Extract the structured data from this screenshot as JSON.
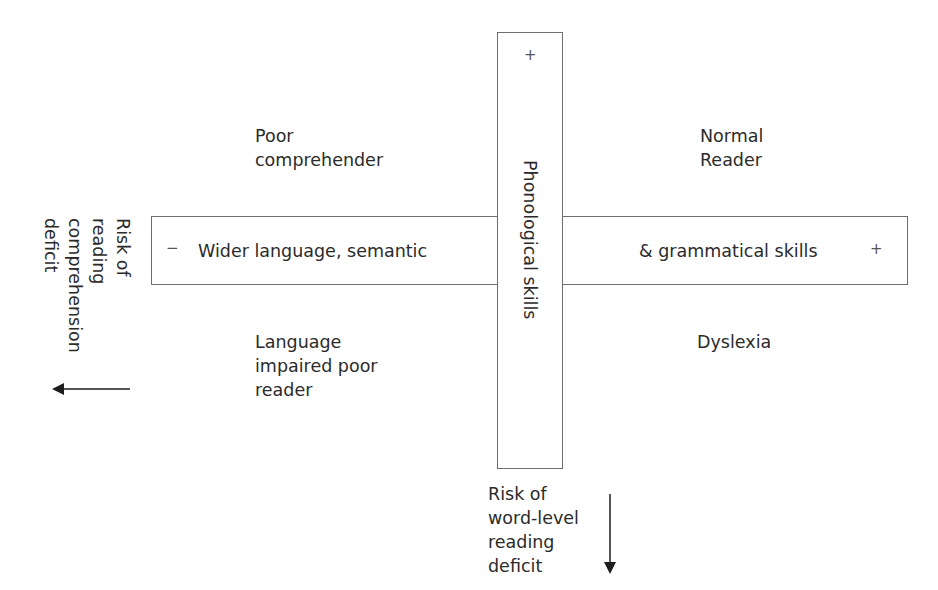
{
  "diagram": {
    "horizontal_axis": {
      "label_left": "Wider language, semantic",
      "label_right": "& grammatical skills",
      "minus_sign": "−",
      "plus_sign": "+"
    },
    "vertical_axis": {
      "label": "Phonological skills",
      "plus_sign": "+"
    },
    "quadrants": {
      "top_left": [
        "Poor",
        "comprehender"
      ],
      "top_right": [
        "Normal",
        "Reader"
      ],
      "bottom_left": [
        "Language",
        "impaired poor",
        "reader"
      ],
      "bottom_right": [
        "Dyslexia"
      ]
    },
    "risk_left": {
      "lines": [
        "Risk of",
        "reading",
        "comprehension",
        "deficit"
      ],
      "arrow_direction": "left"
    },
    "risk_bottom": {
      "lines": [
        "Risk of",
        "word-level",
        "reading",
        "deficit"
      ],
      "arrow_direction": "down"
    },
    "colors": {
      "border": "#6e6e6e",
      "text": "#2b2b2b",
      "arrow": "#1e1e1e"
    }
  }
}
